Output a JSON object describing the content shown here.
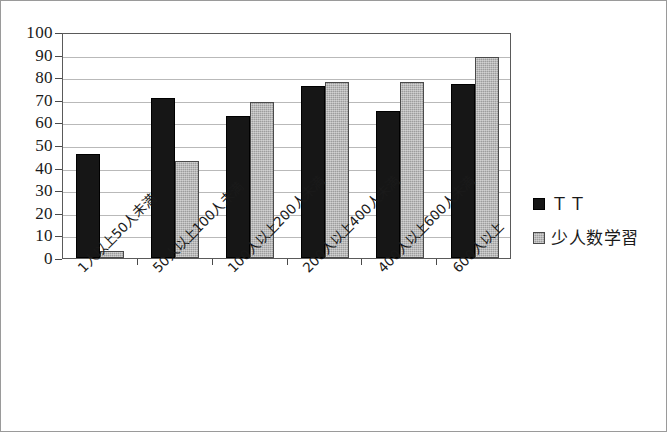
{
  "chart_data": {
    "type": "bar",
    "title": "",
    "xlabel": "",
    "ylabel": "",
    "ylim": [
      0,
      100
    ],
    "ytick_step": 10,
    "yticks": [
      "100",
      "90",
      "80",
      "70",
      "60",
      "50",
      "40",
      "30",
      "20",
      "10",
      "0"
    ],
    "grid": true,
    "legend_position": "right",
    "categories": [
      "1人以上50人未満",
      "50人以上100人未満",
      "100人以上200人未満",
      "200人以上400人未満",
      "400人以上600人未満",
      "600人以上"
    ],
    "series": [
      {
        "name": "ＴＴ",
        "color": "#161616",
        "values": [
          46,
          71,
          63,
          76,
          65,
          77
        ]
      },
      {
        "name": "少人数学習",
        "color": "#9d9d9d",
        "values": [
          3,
          43,
          69,
          78,
          78,
          89
        ]
      }
    ]
  },
  "legend": {
    "items": [
      {
        "label": "ＴＴ",
        "swatch": "black-square-swatch"
      },
      {
        "label": "少人数学習",
        "swatch": "gray-square-swatch"
      }
    ]
  }
}
